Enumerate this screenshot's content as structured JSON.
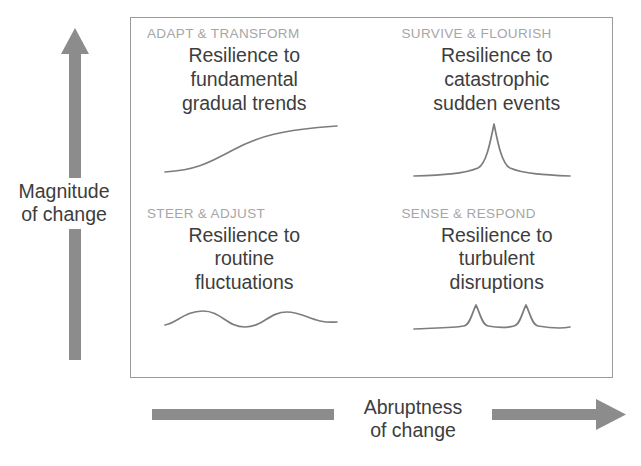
{
  "diagram": {
    "title_present": false,
    "axes": {
      "vertical": {
        "label": "Magnitude\nof change",
        "icon": "up-arrow-icon",
        "color": "#8c8c8c",
        "direction": "up"
      },
      "horizontal": {
        "label": "Abruptness\nof change",
        "icon": "right-arrow-icon",
        "color": "#8c8c8c",
        "direction": "right"
      }
    },
    "panel": {
      "border_color": "#9a9a9a",
      "background": "#ffffff"
    },
    "heading_color": "#a6a6a6",
    "body_color": "#3d3d3d",
    "sparkline_color": "#7d7d7d",
    "quadrants": [
      {
        "id": "adapt-transform",
        "position": "top-left",
        "heading": "ADAPT & TRANSFORM",
        "description": "Resilience to\nfundamental\ngradual trends",
        "sparkline": "s-curve-rising",
        "magnitude": "high",
        "abruptness": "low"
      },
      {
        "id": "survive-flourish",
        "position": "top-right",
        "heading": "SURVIVE & FLOURISH",
        "description": "Resilience to\ncatastrophic\nsudden events",
        "sparkline": "single-tall-spike",
        "magnitude": "high",
        "abruptness": "high"
      },
      {
        "id": "steer-adjust",
        "position": "bottom-left",
        "heading": "STEER & ADJUST",
        "description": "Resilience to\nroutine\nfluctuations",
        "sparkline": "sine-wave",
        "magnitude": "low",
        "abruptness": "low"
      },
      {
        "id": "sense-respond",
        "position": "bottom-right",
        "heading": "SENSE & RESPOND",
        "description": "Resilience to\nturbulent\ndisruptions",
        "sparkline": "two-small-spikes",
        "magnitude": "low",
        "abruptness": "high"
      }
    ]
  }
}
